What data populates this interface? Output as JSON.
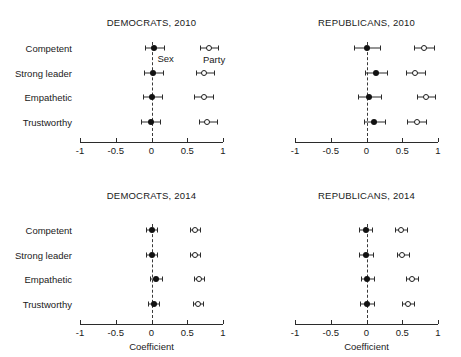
{
  "chart_data": {
    "type": "scatter",
    "title": "",
    "xlabel": "Coefficient",
    "ylabel": "",
    "xlim": [
      -1,
      1
    ],
    "xticks": [
      -1,
      -0.5,
      0,
      0.5,
      1
    ],
    "xticklabels": [
      "-1",
      "-0.5",
      "0",
      "0.5",
      "1"
    ],
    "categories": [
      "Competent",
      "Strong leader",
      "Empathetic",
      "Trustworthy"
    ],
    "grid": false,
    "zero_reference_line": 0,
    "legend": [
      "Sex",
      "Party"
    ],
    "legend_position": "inside-top-left-panel",
    "marker_styles": {
      "Sex": "filled-circle",
      "Party": "open-circle"
    },
    "panels": [
      {
        "title": "DEMOCRATS, 2010",
        "row": 0,
        "col": 0,
        "series": [
          {
            "name": "Sex",
            "points": [
              {
                "category": "Competent",
                "value": 0.04,
                "ci_low": -0.09,
                "ci_high": 0.17
              },
              {
                "category": "Strong leader",
                "value": 0.02,
                "ci_low": -0.11,
                "ci_high": 0.16
              },
              {
                "category": "Empathetic",
                "value": 0.01,
                "ci_low": -0.12,
                "ci_high": 0.15
              },
              {
                "category": "Trustworthy",
                "value": -0.01,
                "ci_low": -0.14,
                "ci_high": 0.12
              }
            ]
          },
          {
            "name": "Party",
            "points": [
              {
                "category": "Competent",
                "value": 0.8,
                "ci_low": 0.68,
                "ci_high": 0.93
              },
              {
                "category": "Strong leader",
                "value": 0.74,
                "ci_low": 0.62,
                "ci_high": 0.87
              },
              {
                "category": "Empathetic",
                "value": 0.73,
                "ci_low": 0.6,
                "ci_high": 0.86
              },
              {
                "category": "Trustworthy",
                "value": 0.78,
                "ci_low": 0.66,
                "ci_high": 0.91
              }
            ]
          }
        ]
      },
      {
        "title": "REPUBLICANS, 2010",
        "row": 0,
        "col": 1,
        "series": [
          {
            "name": "Sex",
            "points": [
              {
                "category": "Competent",
                "value": 0.0,
                "ci_low": -0.18,
                "ci_high": 0.19
              },
              {
                "category": "Strong leader",
                "value": 0.13,
                "ci_low": -0.02,
                "ci_high": 0.29
              },
              {
                "category": "Empathetic",
                "value": 0.04,
                "ci_low": -0.12,
                "ci_high": 0.2
              },
              {
                "category": "Trustworthy",
                "value": 0.11,
                "ci_low": -0.04,
                "ci_high": 0.26
              }
            ]
          },
          {
            "name": "Party",
            "points": [
              {
                "category": "Competent",
                "value": 0.8,
                "ci_low": 0.66,
                "ci_high": 0.94
              },
              {
                "category": "Strong leader",
                "value": 0.68,
                "ci_low": 0.55,
                "ci_high": 0.82
              },
              {
                "category": "Empathetic",
                "value": 0.83,
                "ci_low": 0.7,
                "ci_high": 0.96
              },
              {
                "category": "Trustworthy",
                "value": 0.7,
                "ci_low": 0.57,
                "ci_high": 0.83
              }
            ]
          }
        ]
      },
      {
        "title": "DEMOCRATS, 2014",
        "row": 1,
        "col": 0,
        "series": [
          {
            "name": "Sex",
            "points": [
              {
                "category": "Competent",
                "value": 0.0,
                "ci_low": -0.07,
                "ci_high": 0.08
              },
              {
                "category": "Strong leader",
                "value": 0.0,
                "ci_low": -0.08,
                "ci_high": 0.08
              },
              {
                "category": "Empathetic",
                "value": 0.06,
                "ci_low": -0.02,
                "ci_high": 0.14
              },
              {
                "category": "Trustworthy",
                "value": 0.03,
                "ci_low": -0.05,
                "ci_high": 0.11
              }
            ]
          },
          {
            "name": "Party",
            "points": [
              {
                "category": "Competent",
                "value": 0.61,
                "ci_low": 0.54,
                "ci_high": 0.68
              },
              {
                "category": "Strong leader",
                "value": 0.61,
                "ci_low": 0.54,
                "ci_high": 0.68
              },
              {
                "category": "Empathetic",
                "value": 0.66,
                "ci_low": 0.59,
                "ci_high": 0.73
              },
              {
                "category": "Trustworthy",
                "value": 0.65,
                "ci_low": 0.58,
                "ci_high": 0.72
              }
            ]
          }
        ]
      },
      {
        "title": "REPUBLICANS, 2014",
        "row": 1,
        "col": 1,
        "series": [
          {
            "name": "Sex",
            "points": [
              {
                "category": "Competent",
                "value": -0.01,
                "ci_low": -0.1,
                "ci_high": 0.08
              },
              {
                "category": "Strong leader",
                "value": -0.01,
                "ci_low": -0.1,
                "ci_high": 0.09
              },
              {
                "category": "Empathetic",
                "value": 0.01,
                "ci_low": -0.08,
                "ci_high": 0.11
              },
              {
                "category": "Trustworthy",
                "value": 0.0,
                "ci_low": -0.09,
                "ci_high": 0.1
              }
            ]
          },
          {
            "name": "Party",
            "points": [
              {
                "category": "Competent",
                "value": 0.48,
                "ci_low": 0.4,
                "ci_high": 0.57
              },
              {
                "category": "Strong leader",
                "value": 0.5,
                "ci_low": 0.42,
                "ci_high": 0.59
              },
              {
                "category": "Empathetic",
                "value": 0.63,
                "ci_low": 0.55,
                "ci_high": 0.72
              },
              {
                "category": "Trustworthy",
                "value": 0.58,
                "ci_low": 0.5,
                "ci_high": 0.67
              }
            ]
          }
        ]
      }
    ]
  }
}
